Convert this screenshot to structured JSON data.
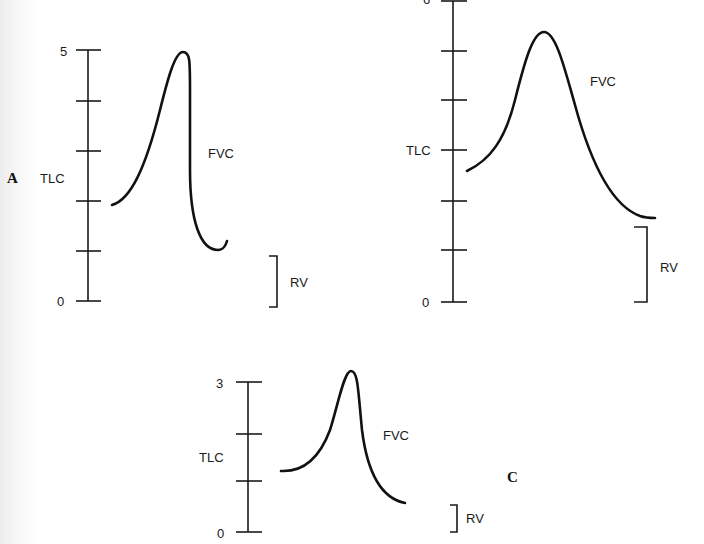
{
  "figure": {
    "panels": [
      {
        "id": "A",
        "panel_letter": "A",
        "axis": {
          "top_label": "5",
          "bottom_label": "0",
          "tick_count": 6
        },
        "tlc_label": "TLC",
        "fvc_label": "FVC",
        "rv_label": "RV"
      },
      {
        "id": "B",
        "panel_letter": "",
        "axis": {
          "top_label": "6",
          "bottom_label": "0",
          "tick_count": 7
        },
        "tlc_label": "TLC",
        "fvc_label": "FVC",
        "rv_label": "RV"
      },
      {
        "id": "C",
        "panel_letter": "C",
        "axis": {
          "top_label": "3",
          "bottom_label": "0",
          "tick_count": 4
        },
        "tlc_label": "TLC",
        "fvc_label": "FVC",
        "rv_label": "RV"
      }
    ]
  },
  "colors": {
    "ink": "#111111",
    "background": "#ffffff"
  }
}
